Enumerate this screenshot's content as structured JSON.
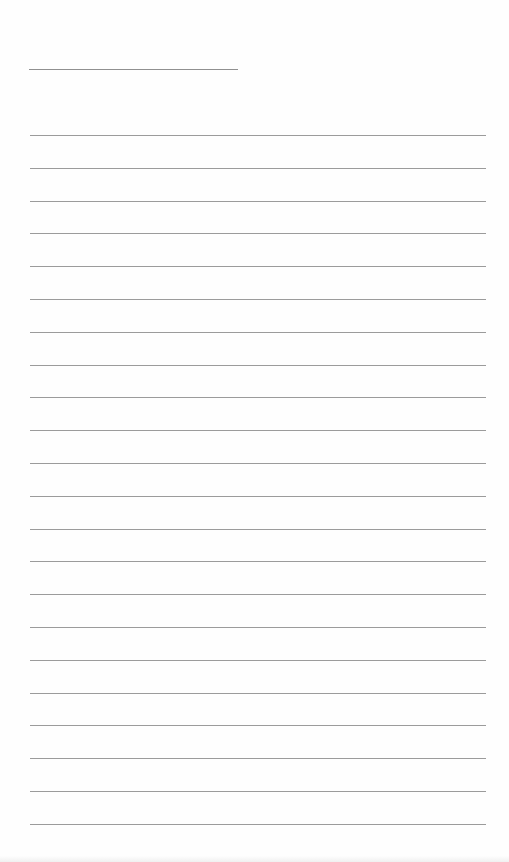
{
  "document": {
    "type": "lined-paper",
    "background_color": "#fefefe",
    "rule_color": "#8a8a8a",
    "title_line": {
      "x1": 29,
      "x2": 238,
      "y": 69
    },
    "writing_lines": {
      "count": 22,
      "first_y": 135,
      "spacing": 32.8,
      "x1": 30,
      "x2": 486
    }
  }
}
